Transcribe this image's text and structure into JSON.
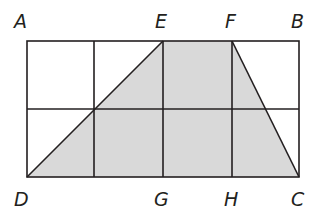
{
  "diagram": {
    "type": "geometry-figure",
    "grid": {
      "columns": 4,
      "rows": 2
    },
    "points": {
      "A": {
        "label": "A",
        "x": 27,
        "y": 41
      },
      "E": {
        "label": "E",
        "x": 163,
        "y": 41
      },
      "F": {
        "label": "F",
        "x": 232,
        "y": 41
      },
      "B": {
        "label": "B",
        "x": 299,
        "y": 41
      },
      "D": {
        "label": "D",
        "x": 27,
        "y": 177
      },
      "G": {
        "label": "G",
        "x": 163,
        "y": 177
      },
      "H": {
        "label": "H",
        "x": 232,
        "y": 177
      },
      "C": {
        "label": "C",
        "x": 299,
        "y": 177
      }
    },
    "shaded_region": {
      "vertices": [
        "D",
        "E",
        "F",
        "C"
      ],
      "color": "#d9d9d9"
    },
    "line_color": "#231f20"
  }
}
